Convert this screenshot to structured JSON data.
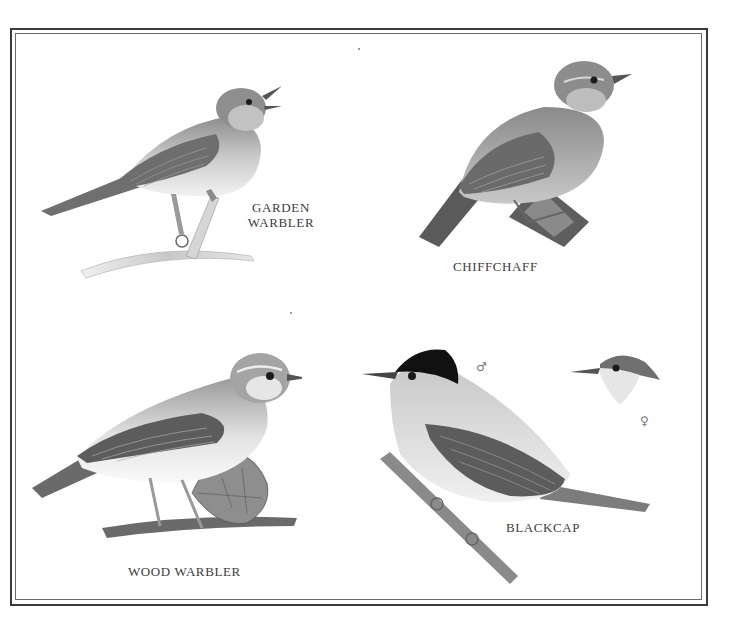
{
  "plate": {
    "background": "#ffffff",
    "border_color": "#3a3a3a",
    "ink_color": "#3c3c3c"
  },
  "birds": [
    {
      "id": "garden-warbler",
      "label_line1": "GARDEN",
      "label_line2": "WARBLER"
    },
    {
      "id": "chiffchaff",
      "label": "CHIFFCHAFF"
    },
    {
      "id": "wood-warbler",
      "label": "WOOD WARBLER"
    },
    {
      "id": "blackcap",
      "label": "BLACKCAP",
      "male_symbol": "♂",
      "female_symbol": "♀"
    }
  ]
}
